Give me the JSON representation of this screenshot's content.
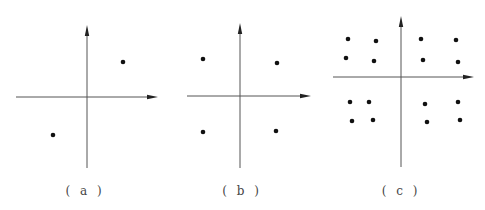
{
  "figure": {
    "panels": [
      {
        "id": "a",
        "label": "( a )",
        "label_x": 85,
        "axes": {
          "origin": [
            87,
            97
          ],
          "x_axis": {
            "from": 16,
            "to": 158
          },
          "y_axis": {
            "from": 168,
            "to": 25
          }
        },
        "points": [
          [
            123,
            62
          ],
          [
            53,
            135
          ]
        ]
      },
      {
        "id": "b",
        "label": "( b )",
        "label_x": 242,
        "axes": {
          "origin": [
            240,
            96
          ],
          "x_axis": {
            "from": 187,
            "to": 311
          },
          "y_axis": {
            "from": 168,
            "to": 23
          }
        },
        "points": [
          [
            203,
            59
          ],
          [
            277,
            63
          ],
          [
            203,
            132
          ],
          [
            276,
            131
          ]
        ]
      },
      {
        "id": "c",
        "label": "( c )",
        "label_x": 401,
        "axes": {
          "origin": [
            401,
            77
          ],
          "x_axis": {
            "from": 333,
            "to": 474
          },
          "y_axis": {
            "from": 167,
            "to": 16
          }
        },
        "points": [
          [
            348,
            39
          ],
          [
            376,
            41
          ],
          [
            421,
            39
          ],
          [
            456,
            40
          ],
          [
            346,
            58
          ],
          [
            374,
            61
          ],
          [
            423,
            60
          ],
          [
            458,
            62
          ],
          [
            350,
            102
          ],
          [
            369,
            102
          ],
          [
            425,
            104
          ],
          [
            458,
            102
          ],
          [
            352,
            121
          ],
          [
            373,
            120
          ],
          [
            427,
            122
          ],
          [
            460,
            120
          ]
        ]
      }
    ],
    "colors": {
      "axis": "#555555",
      "point": "#111111",
      "label": "#444444"
    }
  }
}
